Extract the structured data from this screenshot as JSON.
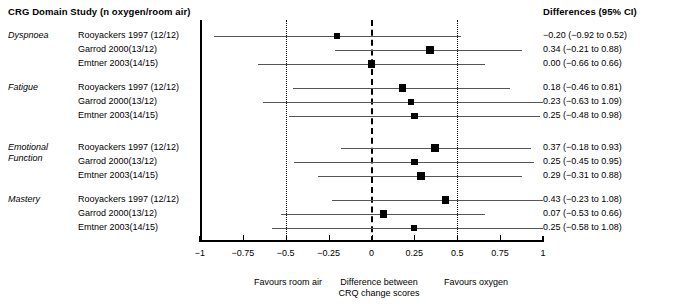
{
  "header": {
    "left_title": "CRG Domain Study (n oxygen/room air)",
    "right_title": "Differences (95% CI)"
  },
  "chart_data": {
    "type": "forest",
    "title": "CRG Domain Study (n oxygen/room air)",
    "xlabel": "Difference between CRQ change scores",
    "ylabel": "",
    "xlim": [
      -1,
      1
    ],
    "grid": true,
    "zero_line": 0,
    "dotted_reference_lines": [
      -0.5,
      0.5
    ],
    "tick_values": [
      -1,
      -0.75,
      -0.5,
      -0.25,
      0,
      0.25,
      0.5,
      0.75,
      1
    ],
    "tick_labels": [
      "−1",
      "−0.75",
      "−0.5",
      "−0.25",
      "0",
      "0.25",
      "0.5",
      "0.75",
      "1"
    ],
    "left_annotation": "Favours room air",
    "center_annotation_line1": "Difference between",
    "center_annotation_line2": "CRQ change scores",
    "right_annotation": "Favours oxygen",
    "ci_header": "Differences (95% CI)",
    "groups": [
      {
        "domain": "Dyspnoea",
        "domain_lines": [
          "Dyspnoea"
        ],
        "rows": [
          {
            "study": "Rooyackers 1997 (12/12)",
            "estimate": -0.2,
            "ci_low": -0.92,
            "ci_high": 0.52,
            "ci_text": "−0.20 (−0.92 to 0.52)"
          },
          {
            "study": "Garrod 2000(13/12)",
            "estimate": 0.34,
            "ci_low": -0.21,
            "ci_high": 0.88,
            "ci_text": "0.34 (−0.21 to 0.88)"
          },
          {
            "study": "Emtner 2003(14/15)",
            "estimate": 0.0,
            "ci_low": -0.66,
            "ci_high": 0.66,
            "ci_text": "0.00 (−0.66 to 0.66)"
          }
        ]
      },
      {
        "domain": "Fatigue",
        "domain_lines": [
          "Fatigue"
        ],
        "rows": [
          {
            "study": "Rooyackers 1997 (12/12)",
            "estimate": 0.18,
            "ci_low": -0.46,
            "ci_high": 0.81,
            "ci_text": "0.18 (−0.46 to 0.81)"
          },
          {
            "study": "Garrod 2000(13/12)",
            "estimate": 0.23,
            "ci_low": -0.63,
            "ci_high": 1.09,
            "ci_text": "0.23 (−0.63 to 1.09)"
          },
          {
            "study": "Emtner 2003(14/15)",
            "estimate": 0.25,
            "ci_low": -0.48,
            "ci_high": 0.98,
            "ci_text": "0.25 (−0.48 to 0.98)"
          }
        ]
      },
      {
        "domain": "Emotional Function",
        "domain_lines": [
          "Emotional",
          "Function"
        ],
        "rows": [
          {
            "study": "Rooyackers 1997 (12/12)",
            "estimate": 0.37,
            "ci_low": -0.18,
            "ci_high": 0.93,
            "ci_text": "0.37 (−0.18 to 0.93)"
          },
          {
            "study": "Garrod 2000(13/12)",
            "estimate": 0.25,
            "ci_low": -0.45,
            "ci_high": 0.95,
            "ci_text": "0.25 (−0.45 to 0.95)"
          },
          {
            "study": "Emtner 2003(14/15)",
            "estimate": 0.29,
            "ci_low": -0.31,
            "ci_high": 0.88,
            "ci_text": "0.29 (−0.31 to 0.88)"
          }
        ]
      },
      {
        "domain": "Mastery",
        "domain_lines": [
          "Mastery"
        ],
        "rows": [
          {
            "study": "Rooyackers 1997 (12/12)",
            "estimate": 0.43,
            "ci_low": -0.23,
            "ci_high": 1.08,
            "ci_text": "0.43 (−0.23 to 1.08)"
          },
          {
            "study": "Garrod 2000(13/12)",
            "estimate": 0.07,
            "ci_low": -0.53,
            "ci_high": 0.66,
            "ci_text": "0.07 (−0.53 to 0.66)"
          },
          {
            "study": "Emtner 2003(14/15)",
            "estimate": 0.25,
            "ci_low": -0.58,
            "ci_high": 1.08,
            "ci_text": "0.25 (−0.58 to 1.08)"
          }
        ]
      }
    ]
  }
}
